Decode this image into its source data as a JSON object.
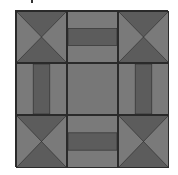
{
  "image": {
    "subject": "quilt-block",
    "colors": {
      "light": "#7a7a7a",
      "dark": "#5c5c5c",
      "line": "#2a2a2a",
      "background": "#ffffff"
    },
    "grid": {
      "rows": 3,
      "cols": 3
    },
    "cells": [
      {
        "type": "hourglass"
      },
      {
        "type": "band-horizontal"
      },
      {
        "type": "hourglass"
      },
      {
        "type": "band-vertical"
      },
      {
        "type": "plain"
      },
      {
        "type": "band-vertical"
      },
      {
        "type": "hourglass"
      },
      {
        "type": "band-horizontal"
      },
      {
        "type": "hourglass"
      }
    ]
  }
}
